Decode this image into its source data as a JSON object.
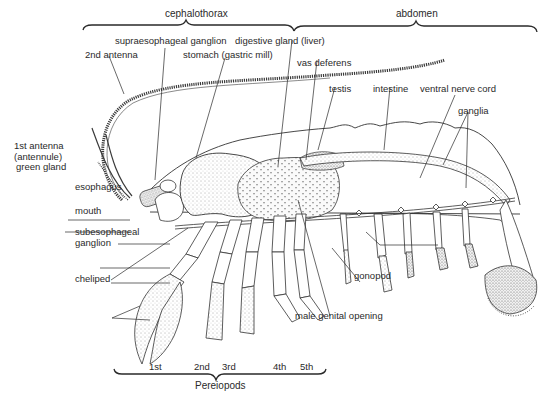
{
  "diagram": {
    "regions": {
      "cephalothorax": "cephalothorax",
      "abdomen": "abdomen",
      "pereiopods": "Pereiopods"
    },
    "labels": {
      "supraesophageal_ganglion": "supraesophageal ganglion",
      "digestive_gland": "digestive gland (liver)",
      "second_antenna": "2nd antenna",
      "stomach": "stomach (gastric mill)",
      "vas_deferens": "vas deferens",
      "testis": "testis",
      "intestine": "intestine",
      "ventral_nerve_cord": "ventral nerve cord",
      "ganglia": "ganglia",
      "first_antenna_line1": "1st antenna",
      "first_antenna_line2": "(antennule)",
      "green_gland": "green gland",
      "esophagus": "esophagus",
      "mouth": "mouth",
      "subesophageal_line1": "subesophageal",
      "subesophageal_line2": "ganglion",
      "cheliped": "cheliped",
      "gonopod": "gonopod",
      "male_genital_opening": "male genital opening"
    },
    "legs": [
      "1st",
      "2nd",
      "3rd",
      "4th",
      "5th"
    ],
    "colors": {
      "ink": "#2a2a2a",
      "stipple": "#555555",
      "background": "#ffffff"
    }
  }
}
